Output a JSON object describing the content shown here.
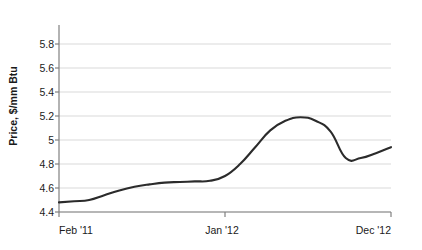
{
  "chart_data": {
    "type": "line",
    "title": "",
    "xlabel": "",
    "ylabel": "Price, $/mm Btu",
    "ylim": [
      4.4,
      5.9
    ],
    "yticks": [
      "4.4",
      "4.6",
      "4.8",
      "5",
      "5.2",
      "5.4",
      "5.6",
      "5.8"
    ],
    "ytick_values": [
      4.4,
      4.6,
      4.8,
      5.0,
      5.2,
      5.4,
      5.6,
      5.8
    ],
    "xticks": [
      "Feb '11",
      "Jan '12",
      "Dec '12"
    ],
    "xtick_positions": [
      0,
      11,
      22
    ],
    "grid": "horizontal",
    "legend": "none",
    "line_color": "#2b2b2b",
    "grid_color": "#d9d9d9",
    "axis_color": "#808080",
    "categories": [
      "Feb '11",
      "Mar '11",
      "Apr '11",
      "May '11",
      "Jun '11",
      "Jul '11",
      "Aug '11",
      "Sep '11",
      "Oct '11",
      "Nov '11",
      "Dec '11",
      "Jan '12",
      "Feb '12",
      "Mar '12",
      "Apr '12",
      "May '12",
      "Jun '12",
      "Jul '12",
      "Aug '12",
      "Sep '12",
      "Oct '12",
      "Nov '12",
      "Dec '12"
    ],
    "series": [
      {
        "name": "Price",
        "values": [
          4.48,
          4.49,
          4.5,
          4.54,
          4.58,
          4.61,
          4.63,
          4.645,
          4.65,
          4.655,
          4.66,
          4.7,
          4.8,
          4.94,
          5.08,
          5.16,
          5.19,
          5.16,
          5.07,
          4.85,
          4.85,
          4.89,
          4.94
        ]
      }
    ]
  }
}
